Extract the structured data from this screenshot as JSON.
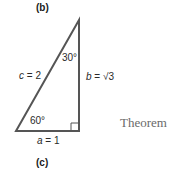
{
  "figure": {
    "top_label": "(b)",
    "bottom_label": "(c)",
    "side_label": "Theorem",
    "triangle": {
      "type": "30-60-90 right triangle",
      "stroke_color": "#555555",
      "hypotenuse": {
        "var": "c",
        "eq": " = 2"
      },
      "vertical_leg": {
        "var": "b",
        "eq": " = √3"
      },
      "horizontal_leg": {
        "var": "a",
        "eq": " = 1"
      },
      "top_angle": "30°",
      "bottom_left_angle": "60°",
      "right_angle_marker": true
    }
  }
}
